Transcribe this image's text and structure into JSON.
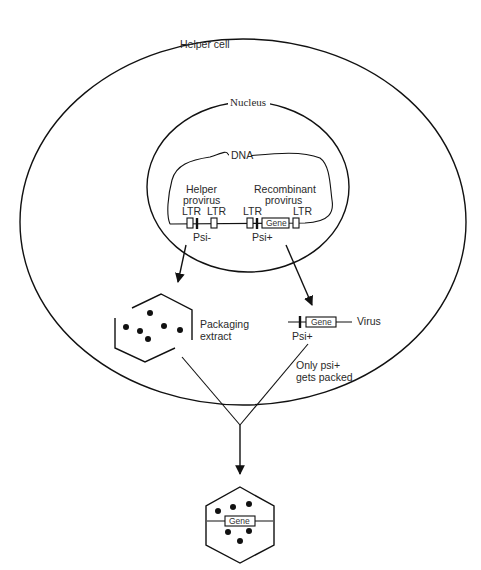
{
  "diagram": {
    "cell_label": "Helper cell",
    "nucleus_label": "Nucleus",
    "dna_label": "DNA",
    "helper_provirus": {
      "title_line1": "Helper",
      "title_line2": "provirus",
      "ltr_left": "LTR",
      "ltr_right": "LTR",
      "psi_label": "Psi-"
    },
    "recombinant_provirus": {
      "title_line1": "Recombinant",
      "title_line2": "provirus",
      "ltr_left": "LTR",
      "ltr_right": "LTR",
      "gene_label": "Gene",
      "psi_label": "Psi+"
    },
    "packaging": {
      "label_line1": "Packaging",
      "label_line2": "extract"
    },
    "virus": {
      "gene_label": "Gene",
      "label": "Virus",
      "psi_label": "Psi+"
    },
    "note": {
      "line1": "Only psi+",
      "line2": "gets packed"
    },
    "final_particle": {
      "gene_label": "Gene"
    }
  }
}
